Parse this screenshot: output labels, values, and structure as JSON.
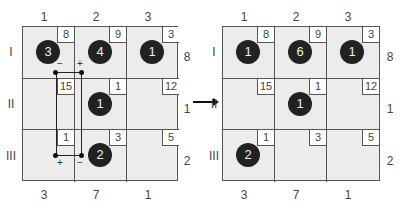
{
  "left": {
    "col_top": [
      "1",
      "2",
      "3"
    ],
    "col_bottom": [
      "3",
      "7",
      "1"
    ],
    "row_left": [
      "I",
      "II",
      "III"
    ],
    "row_right": [
      "8",
      "1",
      "2"
    ],
    "cells": [
      [
        {
          "clue": "8",
          "disc": "3"
        },
        {
          "clue": "9",
          "disc": "4"
        },
        {
          "clue": "3",
          "disc": "1"
        }
      ],
      [
        {
          "clue": "15",
          "disc": ""
        },
        {
          "clue": "1",
          "disc": "1"
        },
        {
          "clue": "12",
          "disc": ""
        }
      ],
      [
        {
          "clue": "1",
          "disc": ""
        },
        {
          "clue": "3",
          "disc": "2"
        },
        {
          "clue": "5",
          "disc": ""
        }
      ]
    ],
    "signs": {
      "top_minus": "−",
      "top_plus": "+",
      "bottom_plus": "+",
      "bottom_minus": "−"
    }
  },
  "right": {
    "col_top": [
      "1",
      "2",
      "3"
    ],
    "col_bottom": [
      "3",
      "7",
      "1"
    ],
    "row_left": [
      "I",
      "II",
      "III"
    ],
    "row_right": [
      "8",
      "1",
      "2"
    ],
    "cells": [
      [
        {
          "clue": "8",
          "disc": "1"
        },
        {
          "clue": "9",
          "disc": "6"
        },
        {
          "clue": "3",
          "disc": "1"
        }
      ],
      [
        {
          "clue": "15",
          "disc": ""
        },
        {
          "clue": "1",
          "disc": "1"
        },
        {
          "clue": "12",
          "disc": ""
        }
      ],
      [
        {
          "clue": "1",
          "disc": "2"
        },
        {
          "clue": "3",
          "disc": ""
        },
        {
          "clue": "5",
          "disc": ""
        }
      ]
    ]
  },
  "arrow": "right-arrow"
}
